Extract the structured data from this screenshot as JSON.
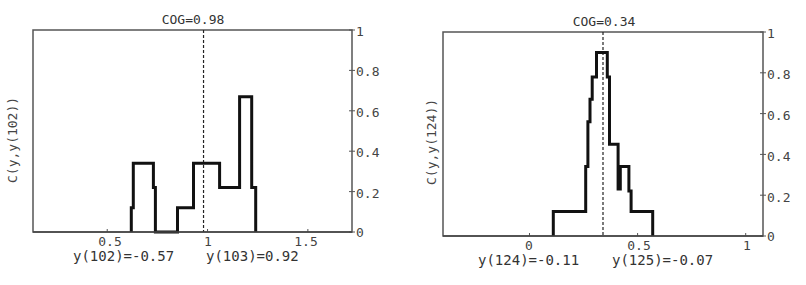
{
  "chart_data": [
    {
      "type": "line",
      "subtype": "step-histogram",
      "title": "COG=0.98",
      "ylabel": "C(y,y(102))",
      "xlabel": "",
      "xlim": [
        0.13,
        1.72
      ],
      "ylim": [
        0,
        1
      ],
      "x_ticks": [
        0.5,
        1,
        1.5
      ],
      "x_tick_labels": [
        "0.5",
        "1",
        "1.5"
      ],
      "y_ticks": [
        0,
        0.2,
        0.4,
        0.6,
        0.8,
        1
      ],
      "y_tick_labels": [
        "0",
        "0.2",
        "0.4",
        "0.6",
        "0.8",
        "1"
      ],
      "y_axis_side": "right",
      "grid": false,
      "cog_line": 0.98,
      "captions": [
        "y(102)=-0.57",
        "y(103)=0.92"
      ],
      "series": [
        {
          "name": "C(y,y(102))",
          "x": [
            0.62,
            0.63,
            0.73,
            0.74,
            0.85,
            0.93,
            1.06,
            1.16,
            1.22,
            1.24
          ],
          "y": [
            0.12,
            0.34,
            0.22,
            0.0,
            0.12,
            0.34,
            0.22,
            0.67,
            0.22,
            0.0
          ]
        }
      ]
    },
    {
      "type": "line",
      "subtype": "step-histogram",
      "title": "COG=0.34",
      "ylabel": "C(y,y(124))",
      "xlabel": "",
      "xlim": [
        -0.4,
        1.08
      ],
      "ylim": [
        0,
        1
      ],
      "x_ticks": [
        0,
        0.5,
        1
      ],
      "x_tick_labels": [
        "0",
        "0.5",
        "1"
      ],
      "y_ticks": [
        0,
        0.2,
        0.4,
        0.6,
        0.8,
        1
      ],
      "y_tick_labels": [
        "0",
        "0.2",
        "0.4",
        "0.6",
        "0.8",
        "1"
      ],
      "y_axis_side": "right",
      "grid": false,
      "cog_line": 0.34,
      "captions": [
        "y(124)=-0.11",
        "y(125)=-0.07"
      ],
      "series": [
        {
          "name": "C(y,y(124))",
          "x": [
            0.11,
            0.26,
            0.27,
            0.28,
            0.29,
            0.31,
            0.36,
            0.37,
            0.41,
            0.42,
            0.46,
            0.47,
            0.57
          ],
          "y": [
            0.12,
            0.34,
            0.56,
            0.67,
            0.78,
            0.9,
            0.78,
            0.45,
            0.23,
            0.34,
            0.22,
            0.12,
            0.0
          ]
        }
      ]
    }
  ],
  "panels": [
    {
      "title": "COG=0.98",
      "ylabel": "C(y,y(102))",
      "caption_left": "y(102)=-0.57",
      "caption_right": "y(103)=0.92",
      "yticks": [
        "1",
        "0.8",
        "0.6",
        "0.4",
        "0.2",
        "0"
      ],
      "xticks": [
        "0.5",
        "1",
        "1.5"
      ]
    },
    {
      "title": "COG=0.34",
      "ylabel": "C(y,y(124))",
      "caption_left": "y(124)=-0.11",
      "caption_right": "y(125)=-0.07",
      "yticks": [
        "1",
        "0.8",
        "0.6",
        "0.4",
        "0.2",
        "0"
      ],
      "xticks": [
        "0",
        "0.5",
        "1"
      ]
    }
  ]
}
